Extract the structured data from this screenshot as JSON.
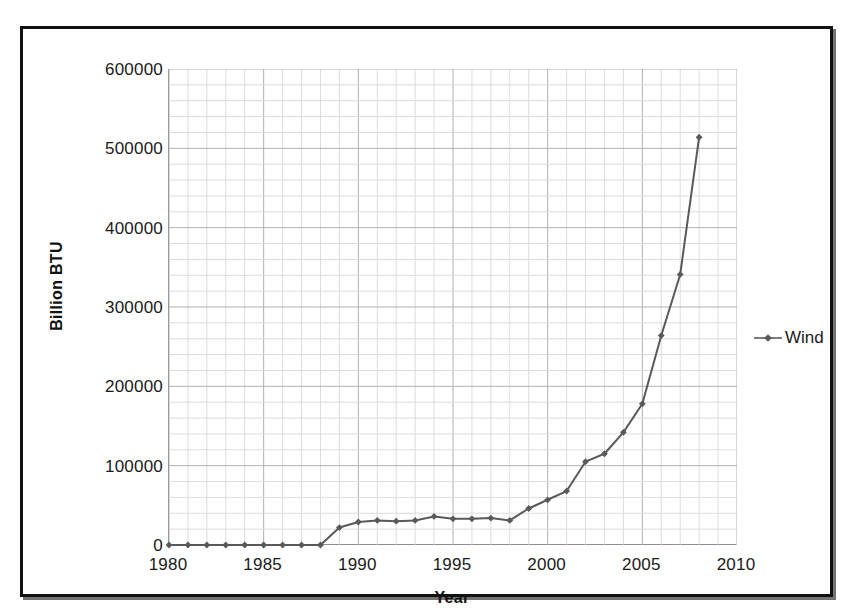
{
  "chart_data": {
    "type": "line",
    "title": "",
    "xlabel": "Year",
    "ylabel": "Billion BTU",
    "xlim": [
      1980,
      2010
    ],
    "ylim": [
      0,
      600000
    ],
    "xticks": [
      1980,
      1985,
      1990,
      1995,
      2000,
      2005,
      2010
    ],
    "yticks": [
      0,
      100000,
      200000,
      300000,
      400000,
      500000,
      600000
    ],
    "ytick_labels": [
      "0",
      "100000",
      "200000",
      "300000",
      "400000",
      "500000",
      "600000"
    ],
    "xtick_labels": [
      "1980",
      "1985",
      "1990",
      "1995",
      "2000",
      "2005",
      "2010"
    ],
    "grid": true,
    "grid_major_x_step": 5,
    "grid_minor_x_step": 1,
    "grid_major_y_step": 100000,
    "grid_minor_y_step": 20000,
    "legend_position": "right",
    "marker": "diamond",
    "series": [
      {
        "name": "Wind",
        "color": "#595959",
        "x": [
          1980,
          1981,
          1982,
          1983,
          1984,
          1985,
          1986,
          1987,
          1988,
          1989,
          1990,
          1991,
          1992,
          1993,
          1994,
          1995,
          1996,
          1997,
          1998,
          1999,
          2000,
          2001,
          2002,
          2003,
          2004,
          2005,
          2006,
          2007,
          2008
        ],
        "values": [
          0,
          0,
          0,
          0,
          0,
          0,
          0,
          0,
          0,
          22000,
          29000,
          31000,
          30000,
          31000,
          36000,
          33000,
          33000,
          34000,
          31000,
          46000,
          57000,
          68000,
          105000,
          115000,
          142000,
          178000,
          264000,
          341000,
          514000
        ]
      }
    ]
  },
  "legend": {
    "entries": [
      {
        "label": "Wind",
        "marker": "diamond-line-marker",
        "color": "#595959"
      }
    ]
  },
  "axes": {
    "y_title": "Billion BTU",
    "x_title": "Year"
  },
  "colors": {
    "series": "#595959",
    "frame": "#111111",
    "grid_major": "#b0b0b0",
    "grid_minor": "#dcdcdc",
    "text": "#1a1a1a",
    "background": "#ffffff"
  }
}
